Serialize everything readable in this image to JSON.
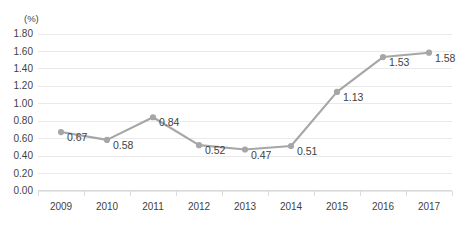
{
  "chart_data": {
    "type": "line",
    "title": "",
    "subtitle": "",
    "xlabel": "",
    "ylabel": "",
    "unit_label": "(%)",
    "categories": [
      "2009",
      "2010",
      "2011",
      "2012",
      "2013",
      "2014",
      "2015",
      "2016",
      "2017"
    ],
    "values": [
      0.67,
      0.58,
      0.84,
      0.52,
      0.47,
      0.51,
      1.13,
      1.53,
      1.58
    ],
    "point_labels": [
      "0.67",
      "0.58",
      "0.84",
      "0.52",
      "0.47",
      "0.51",
      "1.13",
      "1.53",
      "1.58"
    ],
    "ylim": [
      0.0,
      1.8
    ],
    "ytick_values": [
      1.8,
      1.6,
      1.4,
      1.2,
      1.0,
      0.8,
      0.6,
      0.4,
      0.2,
      0.0
    ],
    "ytick_labels": [
      "1.80",
      "1.60",
      "1.40",
      "1.20",
      "1.00",
      "0.80",
      "0.60",
      "0.40",
      "0.20",
      "0.00"
    ],
    "grid": true,
    "legend": "none",
    "series": [
      {
        "name": "",
        "values": [
          0.67,
          0.58,
          0.84,
          0.52,
          0.47,
          0.51,
          1.13,
          1.53,
          1.58
        ]
      }
    ],
    "colors": {
      "line": "#a6a6a6",
      "marker": "#a6a6a6",
      "text": "#3f3f3f",
      "gridline": "#e9e9e9",
      "axis": "#d9d9d9",
      "background": "#ffffff"
    }
  }
}
